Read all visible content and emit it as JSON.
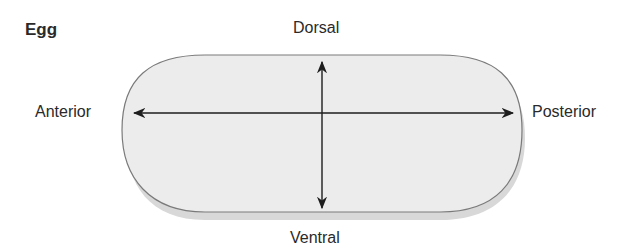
{
  "title": "Egg",
  "axes": {
    "dorsal": "Dorsal",
    "ventral": "Ventral",
    "anterior": "Anterior",
    "posterior": "Posterior"
  },
  "colors": {
    "egg_fill": "#ececec",
    "egg_shadow": "#d6d6d6",
    "outline": "#7a7a7a",
    "arrow": "#1e1e1e"
  }
}
